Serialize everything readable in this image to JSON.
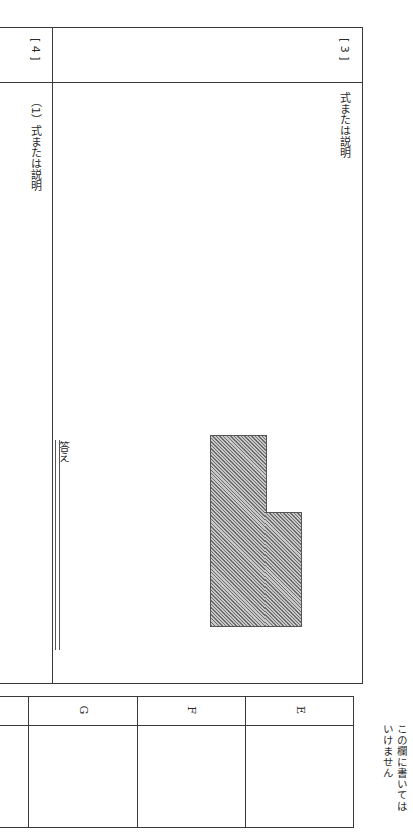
{
  "page": {
    "orientation": "rotated-90-clockwise"
  },
  "section3": {
    "number": "[ 3 ]",
    "label": "式または説明"
  },
  "section4": {
    "number": "[ 4 ]",
    "subquestion": "（1）式または説明",
    "answer_label": "答え"
  },
  "figure": {
    "fill": "#9a9a9a"
  },
  "score_table": {
    "columns": [
      "E",
      "F",
      "G"
    ]
  },
  "margin_note": {
    "line1": "この欄に書いては",
    "line2": "いけません"
  }
}
